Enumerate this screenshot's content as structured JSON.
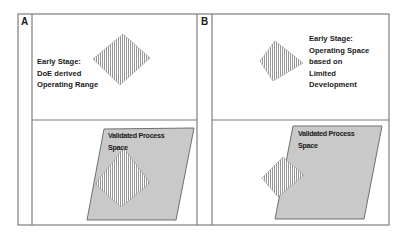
{
  "panels": [
    {
      "letter": "A",
      "top": {
        "caption_lines": [
          "Early Stage:",
          "DoE derived",
          "Operating Range"
        ]
      },
      "bottom": {
        "region_label_lines": [
          "Validated Process",
          "Space"
        ]
      }
    },
    {
      "letter": "B",
      "top": {
        "caption_lines": [
          "Early Stage:",
          "Operating Space",
          "based on",
          "Limited",
          "Development"
        ]
      },
      "bottom": {
        "region_label_lines": [
          "Validated Process",
          "Space"
        ]
      }
    }
  ],
  "colors": {
    "grid_line": "#7d7d7d",
    "process_space_fill": "#c9c9c9",
    "process_space_stroke": "#6f6f6f",
    "hatch_line": "#8a8a8a",
    "hatch_bg": "#ffffff",
    "text": "#1a1a1a"
  }
}
